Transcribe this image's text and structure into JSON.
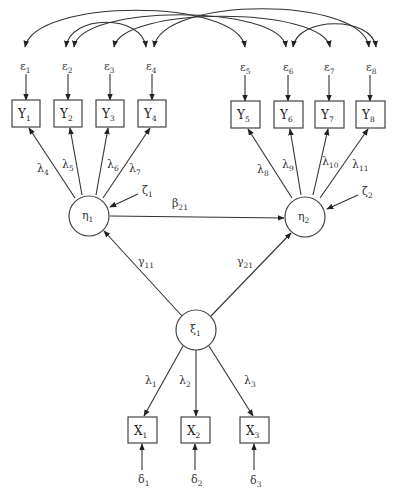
{
  "diagram": {
    "type": "structural-equation-model",
    "colors": {
      "stroke": "#333333",
      "background": "#ffffff",
      "text": "#333333"
    },
    "observed_y": [
      {
        "id": "Y1",
        "base": "Y",
        "sub": "1"
      },
      {
        "id": "Y2",
        "base": "Y",
        "sub": "2"
      },
      {
        "id": "Y3",
        "base": "Y",
        "sub": "3"
      },
      {
        "id": "Y4",
        "base": "Y",
        "sub": "4"
      },
      {
        "id": "Y5",
        "base": "Y",
        "sub": "5"
      },
      {
        "id": "Y6",
        "base": "Y",
        "sub": "6"
      },
      {
        "id": "Y7",
        "base": "Y",
        "sub": "7"
      },
      {
        "id": "Y8",
        "base": "Y",
        "sub": "8"
      }
    ],
    "errors_y": [
      {
        "base": "ε",
        "sub": "1"
      },
      {
        "base": "ε",
        "sub": "2"
      },
      {
        "base": "ε",
        "sub": "3"
      },
      {
        "base": "ε",
        "sub": "4"
      },
      {
        "base": "ε",
        "sub": "5"
      },
      {
        "base": "ε",
        "sub": "6"
      },
      {
        "base": "ε",
        "sub": "7"
      },
      {
        "base": "ε",
        "sub": "8"
      }
    ],
    "error_correlations": [
      {
        "from": "ε1",
        "to": "ε5"
      },
      {
        "from": "ε2",
        "to": "ε4"
      },
      {
        "from": "ε2",
        "to": "ε6"
      },
      {
        "from": "ε3",
        "to": "ε7"
      },
      {
        "from": "ε4",
        "to": "ε8"
      },
      {
        "from": "ε6",
        "to": "ε8"
      }
    ],
    "latent_endogenous": [
      {
        "id": "eta1",
        "base": "η",
        "sub": "1"
      },
      {
        "id": "eta2",
        "base": "η",
        "sub": "2"
      }
    ],
    "latent_exogenous": [
      {
        "id": "xi1",
        "base": "ξ",
        "sub": "1"
      }
    ],
    "disturbances": [
      {
        "base": "ζ",
        "sub": "1"
      },
      {
        "base": "ζ",
        "sub": "2"
      }
    ],
    "loadings_y": [
      {
        "base": "λ",
        "sub": "4"
      },
      {
        "base": "λ",
        "sub": "5"
      },
      {
        "base": "λ",
        "sub": "6"
      },
      {
        "base": "λ",
        "sub": "7"
      },
      {
        "base": "λ",
        "sub": "8"
      },
      {
        "base": "λ",
        "sub": "9"
      },
      {
        "base": "λ",
        "sub": "10"
      },
      {
        "base": "λ",
        "sub": "11"
      }
    ],
    "structural_paths": {
      "beta": {
        "base": "β",
        "sub": "21"
      },
      "gamma11": {
        "base": "γ",
        "sub": "11"
      },
      "gamma21": {
        "base": "γ",
        "sub": "21"
      }
    },
    "loadings_x": [
      {
        "base": "λ",
        "sub": "1"
      },
      {
        "base": "λ",
        "sub": "2"
      },
      {
        "base": "λ",
        "sub": "3"
      }
    ],
    "observed_x": [
      {
        "id": "X1",
        "base": "X",
        "sub": "1"
      },
      {
        "id": "X2",
        "base": "X",
        "sub": "2"
      },
      {
        "id": "X3",
        "base": "X",
        "sub": "3"
      }
    ],
    "errors_x": [
      {
        "base": "δ",
        "sub": "1"
      },
      {
        "base": "δ",
        "sub": "2"
      },
      {
        "base": "δ",
        "sub": "3"
      }
    ]
  }
}
